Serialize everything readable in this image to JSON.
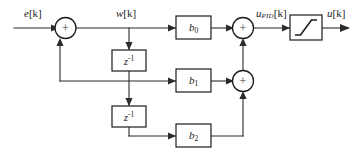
{
  "diagram": {
    "type": "block-diagram",
    "background_color": "#ffffff",
    "line_color": "#2b2b2b",
    "block_border_color": "#1c1c1c",
    "signals": {
      "input": "e[k]",
      "input_var": "e",
      "input_index": "[k]",
      "intermediate": "w[k]",
      "intermediate_var": "w",
      "intermediate_index": "[k]",
      "presat_var": "u",
      "presat_sub": "PID",
      "presat_index": "[k]",
      "output_var": "u",
      "output_index": "[k]"
    },
    "blocks": [
      {
        "id": "delay1",
        "label_base": "z",
        "label_sup": "-1",
        "name": "unit-delay"
      },
      {
        "id": "delay2",
        "label_base": "z",
        "label_sup": "-1",
        "name": "unit-delay"
      },
      {
        "id": "gain0",
        "label_base": "b",
        "label_sub": "0",
        "name": "gain-b0"
      },
      {
        "id": "gain1",
        "label_base": "b",
        "label_sub": "1",
        "name": "gain-b1"
      },
      {
        "id": "gain2",
        "label_base": "b",
        "label_sub": "2",
        "name": "gain-b2"
      },
      {
        "id": "saturation",
        "label_base": "",
        "name": "saturation-limiter"
      }
    ],
    "summing_junctions": [
      {
        "id": "sum1",
        "sign": "+"
      },
      {
        "id": "sum2",
        "sign": "+"
      },
      {
        "id": "sum3",
        "sign": "+"
      }
    ]
  }
}
